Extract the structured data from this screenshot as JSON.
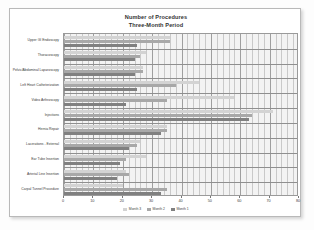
{
  "chart_data": {
    "type": "bar",
    "orientation": "horizontal",
    "title": "Number of Procedures",
    "subtitle": "Three-Month Period",
    "title_lines": [
      "Number of Procedures",
      "Three-Month Period"
    ],
    "xlabel": "",
    "ylabel": "",
    "xlim": [
      0,
      80
    ],
    "xticks": [
      0,
      10,
      20,
      30,
      40,
      50,
      60,
      70,
      80
    ],
    "xtick_labels": [
      "0",
      "10",
      "20",
      "30",
      "40",
      "50",
      "60",
      "70",
      "80"
    ],
    "minor_gridlines": true,
    "minor_tick_step": 2,
    "grid": true,
    "legend_position": "bottom",
    "categories": [
      "Upper GI Endoscopy",
      "Thoracoscopy",
      "Pelvic/Abdominal Laparoscopy",
      "Left Heart Catheterization",
      "Video Arthroscopy",
      "Injections",
      "Hernia Repair",
      "Lacerations - External",
      "Ear Tube Insertion",
      "Arterial Line Insertion",
      "Carpal Tunnel Procedure"
    ],
    "series": [
      {
        "name": "Month 3",
        "color": "#d3d3d3",
        "values": [
          36,
          28,
          27,
          46,
          58,
          71,
          35,
          26,
          28,
          21,
          20
        ]
      },
      {
        "name": "Month 2",
        "color": "#a8a8a8",
        "values": [
          36,
          26,
          27,
          38,
          35,
          64,
          35,
          25,
          21,
          22,
          35
        ]
      },
      {
        "name": "Month 1",
        "color": "#808080",
        "values": [
          25,
          24,
          24,
          25,
          21,
          63,
          33,
          22,
          19,
          18,
          33
        ]
      }
    ]
  },
  "legend": {
    "items": [
      {
        "label": "Month 3",
        "color": "#d3d3d3"
      },
      {
        "label": "Month 2",
        "color": "#a8a8a8"
      },
      {
        "label": "Month 1",
        "color": "#808080"
      }
    ]
  },
  "colors": {
    "plot_background": "#f3f3f3",
    "card_background": "#ffffff",
    "grid_minor": "#c9c9c9",
    "grid_major": "#9f9f9f",
    "axis": "#777777",
    "text": "#3a3a3a"
  }
}
